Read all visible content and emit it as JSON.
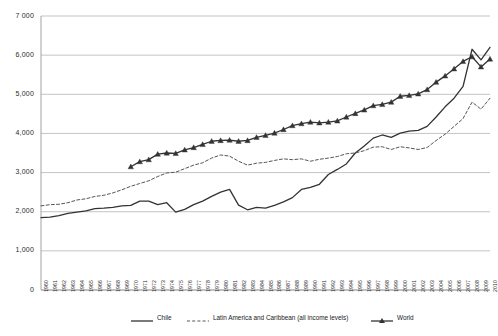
{
  "chart_data": {
    "type": "line",
    "title": "",
    "xlabel": "",
    "ylabel": "",
    "ylim": [
      0,
      7000
    ],
    "xlim": [
      1960,
      2010
    ],
    "grid": true,
    "legend_position": "bottom",
    "ytick_labels": [
      "7 000",
      "6,000",
      "5,000",
      "4,000",
      "3,000",
      "2,000",
      "1,000",
      "0"
    ],
    "ytick_values": [
      7000,
      6000,
      5000,
      4000,
      3000,
      2000,
      1000,
      0
    ],
    "x": [
      1960,
      1961,
      1962,
      1963,
      1964,
      1965,
      1966,
      1967,
      1968,
      1969,
      1970,
      1971,
      1972,
      1973,
      1974,
      1975,
      1976,
      1977,
      1978,
      1979,
      1980,
      1981,
      1982,
      1983,
      1984,
      1985,
      1986,
      1987,
      1988,
      1989,
      1990,
      1991,
      1992,
      1993,
      1994,
      1995,
      1996,
      1997,
      1998,
      1999,
      2000,
      2001,
      2002,
      2003,
      2004,
      2005,
      2006,
      2007,
      2008,
      2009,
      2010
    ],
    "xtick_labels": [
      "1960",
      "1961",
      "1962",
      "1963",
      "1964",
      "1965",
      "1966",
      "1967",
      "1968",
      "1969",
      "1970",
      "1971",
      "1972",
      "1973",
      "1974",
      "1975",
      "1976",
      "1977",
      "1978",
      "1979",
      "1980",
      "1981",
      "1982",
      "1983",
      "1984",
      "1985",
      "1986",
      "1987",
      "1988",
      "1989",
      "1990",
      "1991",
      "1992",
      "1993",
      "1994",
      "1995",
      "1996",
      "1997",
      "1998",
      "1999",
      "2000",
      "2001",
      "2002",
      "2003",
      "2004",
      "2005",
      "2006",
      "2007",
      "2008",
      "2009",
      "2010"
    ],
    "series": [
      {
        "name": "Chile",
        "style": "solid",
        "color": "#333333",
        "marker": "none",
        "values": [
          1850,
          1860,
          1900,
          1960,
          1990,
          2020,
          2080,
          2090,
          2110,
          2150,
          2160,
          2270,
          2270,
          2180,
          2230,
          1990,
          2060,
          2180,
          2270,
          2390,
          2500,
          2570,
          2170,
          2050,
          2110,
          2090,
          2160,
          2250,
          2360,
          2570,
          2620,
          2700,
          2950,
          3080,
          3220,
          3500,
          3680,
          3880,
          3960,
          3900,
          4010,
          4060,
          4080,
          4180,
          4420,
          4680,
          4900,
          5200,
          6150,
          5880,
          6200
        ]
      },
      {
        "name": "Latin America and Caribbean (all income levels)",
        "style": "dashed",
        "color": "#555555",
        "marker": "none",
        "values": [
          2150,
          2180,
          2190,
          2230,
          2300,
          2330,
          2390,
          2420,
          2480,
          2560,
          2650,
          2720,
          2790,
          2900,
          2990,
          3010,
          3100,
          3190,
          3250,
          3370,
          3450,
          3420,
          3290,
          3190,
          3240,
          3260,
          3310,
          3350,
          3330,
          3350,
          3290,
          3340,
          3370,
          3410,
          3480,
          3500,
          3560,
          3650,
          3660,
          3590,
          3660,
          3630,
          3590,
          3640,
          3820,
          3980,
          4180,
          4380,
          4800,
          4620,
          4900
        ]
      },
      {
        "name": "World",
        "style": "solid",
        "color": "#333333",
        "marker": "triangle",
        "values": [
          null,
          null,
          null,
          null,
          null,
          null,
          null,
          null,
          null,
          null,
          3150,
          3280,
          3330,
          3470,
          3500,
          3490,
          3580,
          3640,
          3720,
          3800,
          3820,
          3830,
          3800,
          3820,
          3900,
          3950,
          4010,
          4100,
          4200,
          4250,
          4290,
          4270,
          4290,
          4320,
          4420,
          4510,
          4600,
          4710,
          4740,
          4800,
          4950,
          4970,
          5010,
          5120,
          5310,
          5470,
          5650,
          5840,
          5960,
          5700,
          5900
        ]
      }
    ]
  }
}
